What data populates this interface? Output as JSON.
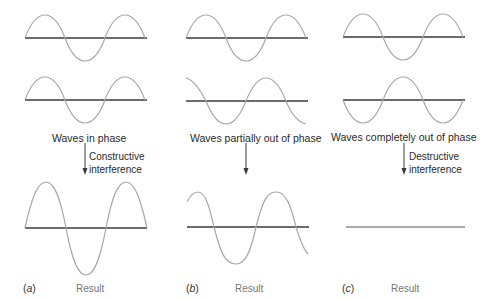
{
  "panels": [
    {
      "letter": "a",
      "letter_open": "(",
      "letter_close": ")",
      "caption": "Waves in phase",
      "interference_line1": "Constructive",
      "interference_line2": "interference",
      "result_label": "Result"
    },
    {
      "letter": "b",
      "letter_open": "(",
      "letter_close": ")",
      "caption": "Waves partially out of phase",
      "interference_line1": "",
      "interference_line2": "",
      "result_label": "Result"
    },
    {
      "letter": "c",
      "letter_open": "(",
      "letter_close": ")",
      "caption": "Waves completely out of phase",
      "interference_line1": "Destructive",
      "interference_line2": "interference",
      "result_label": "Result"
    }
  ],
  "colors": {
    "wave": "#a8a8a8",
    "axis": "#3a3a3a",
    "arrow": "#3a3a3a",
    "text": "#2a2a2a",
    "result_text": "#777777"
  }
}
